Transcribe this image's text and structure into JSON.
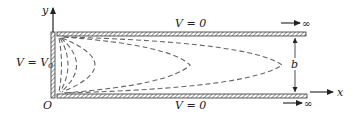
{
  "figure": {
    "colors": {
      "plate_fill": "#ffffff",
      "plate_stroke": "#333333",
      "hatch": "#555555",
      "dash": "#666666",
      "ink": "#222222"
    }
  },
  "labels": {
    "y_axis": "y",
    "x_axis": "x",
    "origin": "O",
    "top_plate": "V = 0",
    "bottom_plate": "V = 0",
    "left_plate_v": "V = V",
    "left_plate_sub": "0",
    "gap": "b",
    "infinity_top": "∞",
    "infinity_bottom": "∞"
  },
  "equipotentials": {
    "count": 6,
    "style": "dashed"
  }
}
